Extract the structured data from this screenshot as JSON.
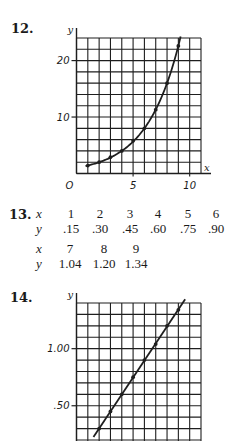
{
  "problems": [
    {
      "number": "12."
    },
    {
      "number": "13."
    },
    {
      "number": "14."
    }
  ],
  "chart_data": [
    {
      "id": "problem-12",
      "type": "scatter",
      "curve": "exponential",
      "title": "",
      "xlabel": "x",
      "ylabel": "y",
      "origin_label": "O",
      "x": [
        1,
        2,
        3,
        4,
        5,
        6,
        7,
        8,
        9
      ],
      "values": [
        1.4,
        2.0,
        2.9,
        4.0,
        5.8,
        8.0,
        11.3,
        16.0,
        22.6
      ],
      "curve_x_range": [
        0.8,
        9.2
      ],
      "xlim": [
        0,
        11
      ],
      "ylim": [
        0,
        24
      ],
      "x_grid_step": 1,
      "y_grid_step": 2,
      "xticks": [
        5,
        10
      ],
      "xtick_labels": [
        "5",
        "10"
      ],
      "yticks": [
        10,
        20
      ],
      "ytick_labels": [
        "10",
        "20"
      ],
      "grid": true
    },
    {
      "id": "problem-14",
      "type": "scatter",
      "curve": "linear",
      "title": "",
      "xlabel": "",
      "ylabel": "y",
      "x": [
        1,
        2,
        3,
        4,
        5,
        6,
        7,
        8,
        9
      ],
      "values": [
        0.15,
        0.3,
        0.45,
        0.6,
        0.75,
        0.9,
        1.04,
        1.2,
        1.34
      ],
      "line_x_range": [
        1.5,
        9.6
      ],
      "xlim": [
        0,
        11
      ],
      "ylim": [
        0.2,
        1.4
      ],
      "x_grid_step": 1,
      "y_grid_step": 0.1,
      "yticks": [
        0.5,
        1.0
      ],
      "ytick_labels": [
        ".50",
        "1.00"
      ],
      "grid": true
    }
  ],
  "table13": {
    "rows": [
      {
        "var": "x",
        "values": [
          "1",
          "2",
          "3",
          "4",
          "5",
          "6"
        ]
      },
      {
        "var": "y",
        "values": [
          ".15",
          ".30",
          ".45",
          ".60",
          ".75",
          ".90"
        ]
      },
      {
        "var": "x",
        "values": [
          "7",
          "8",
          "9"
        ]
      },
      {
        "var": "y",
        "values": [
          "1.04",
          "1.20",
          "1.34"
        ]
      }
    ]
  }
}
